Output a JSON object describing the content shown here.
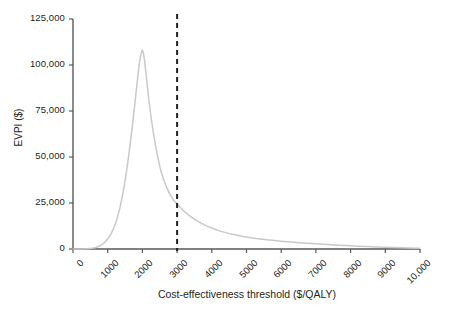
{
  "chart_data": {
    "type": "line",
    "title": "",
    "xlabel": "Cost-effectiveness threshold ($/QALY)",
    "ylabel": "EVPI ($)",
    "xlim": [
      0,
      10000
    ],
    "ylim": [
      0,
      125000
    ],
    "grid": false,
    "legend": null,
    "xticks": [
      0,
      1000,
      2000,
      3000,
      4000,
      5000,
      6000,
      7000,
      8000,
      9000,
      10000
    ],
    "xtick_labels": [
      "0",
      "1000",
      "2000",
      "3000",
      "4000",
      "5000",
      "6000",
      "7000",
      "8000",
      "9000",
      "10,000"
    ],
    "yticks": [
      0,
      25000,
      50000,
      75000,
      100000,
      125000
    ],
    "ytick_labels": [
      "0",
      "25,000",
      "50,000",
      "75,000",
      "100,000",
      "125,000"
    ],
    "series": [
      {
        "name": "EVPI",
        "color": "#c9c9c9",
        "x": [
          0,
          200,
          400,
          600,
          700,
          800,
          900,
          1000,
          1100,
          1200,
          1300,
          1400,
          1500,
          1600,
          1700,
          1800,
          1900,
          1950,
          2000,
          2050,
          2100,
          2200,
          2300,
          2400,
          2500,
          2600,
          2700,
          2800,
          2900,
          3000,
          3200,
          3400,
          3600,
          3800,
          4000,
          4200,
          4400,
          4600,
          4800,
          5000,
          5400,
          5800,
          6200,
          6600,
          7000,
          7500,
          8000,
          8500,
          9000,
          9500,
          10000
        ],
        "y": [
          0,
          0,
          150,
          600,
          1100,
          2000,
          3400,
          5400,
          8400,
          12600,
          18500,
          26500,
          37000,
          50000,
          65000,
          82000,
          99000,
          105000,
          108000,
          104000,
          96000,
          79000,
          65000,
          54000,
          45000,
          38500,
          33500,
          29500,
          26500,
          24500,
          20500,
          17500,
          15000,
          13000,
          11400,
          10000,
          8900,
          8000,
          7200,
          6500,
          5400,
          4600,
          3900,
          3300,
          2800,
          2200,
          1700,
          1300,
          1000,
          700,
          450
        ]
      }
    ],
    "annotations": [
      {
        "type": "vertical-dashed-line",
        "x": 3000,
        "color": "#231f20",
        "dash": "5,4",
        "width": 2
      }
    ]
  },
  "axes_geometry": {
    "left_px": 73,
    "right_px": 420,
    "top_px": 19,
    "bottom_px": 249
  }
}
